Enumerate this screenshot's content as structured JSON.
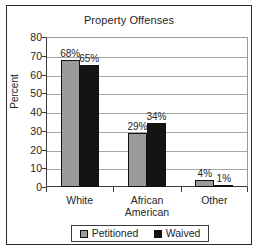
{
  "chart_data": {
    "type": "bar",
    "title": "Property Offenses",
    "xlabel": "",
    "ylabel": "Percent",
    "ylim": [
      0,
      80
    ],
    "ytick_step": 10,
    "yticks": [
      80,
      70,
      60,
      50,
      40,
      30,
      20,
      10,
      0
    ],
    "grid": true,
    "legend_position": "bottom",
    "categories": [
      "White",
      "African American",
      "Other"
    ],
    "category_lines": [
      [
        "White"
      ],
      [
        "African",
        "American"
      ],
      [
        "Other"
      ]
    ],
    "series": [
      {
        "name": "Petitioned",
        "color": "#9b9b9b",
        "values": [
          68,
          29,
          4
        ],
        "labels": [
          "68%",
          "29%",
          "4%"
        ]
      },
      {
        "name": "Waived",
        "color": "#141414",
        "values": [
          65,
          34,
          1
        ],
        "labels": [
          "65%",
          "34%",
          "1%"
        ]
      }
    ]
  },
  "legend": {
    "items": [
      {
        "label": "Petitioned",
        "swatch": "legend-swatch-petitioned"
      },
      {
        "label": "Waived",
        "swatch": "legend-swatch-waived"
      }
    ]
  },
  "colors": {
    "petitioned": "#9b9b9b",
    "waived": "#141414",
    "axis": "#3a3a3a",
    "gridline": "#a5a5a5",
    "frame": "#2b2b2b",
    "background": "#ffffff",
    "text": "#252525"
  }
}
